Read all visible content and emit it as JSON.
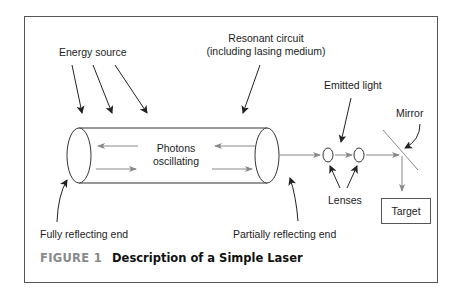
{
  "figure": {
    "number_label": "FIGURE 1",
    "title": "Description of a Simple Laser"
  },
  "labels": {
    "energy_source": "Energy source",
    "resonant_circuit_line1": "Resonant circuit",
    "resonant_circuit_line2": "(including lasing medium)",
    "photons_line1": "Photons",
    "photons_line2": "oscillating",
    "emitted_light": "Emitted light",
    "mirror": "Mirror",
    "lenses": "Lenses",
    "target": "Target",
    "fully_reflecting_end": "Fully reflecting end",
    "partially_reflecting_end": "Partially reflecting end"
  },
  "colors": {
    "line": "#333333",
    "light_arrow": "#888888",
    "frame": "#555555",
    "caption_label": "#8a8a8a"
  }
}
